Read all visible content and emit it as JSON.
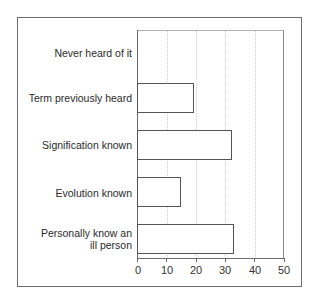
{
  "chart_data": {
    "type": "bar",
    "orientation": "horizontal",
    "title": "",
    "xlabel": "",
    "ylabel": "",
    "categories": [
      "Never heard of it",
      "Term previously heard",
      "Signification known",
      "Evolution known",
      "Personally know an ill person"
    ],
    "values": [
      0,
      19.5,
      32.5,
      15,
      33
    ],
    "xlim": [
      0,
      50
    ],
    "xticks": [
      "0",
      "10",
      "20",
      "30",
      "40",
      "50"
    ],
    "grid": "vertical dotted",
    "legend": "none"
  },
  "labels": {
    "cat0": "Never heard of it",
    "cat1": "Term previously heard",
    "cat2": "Signification known",
    "cat3": "Evolution known",
    "cat4_line1": "Personally know an",
    "cat4_line2": "ill person"
  },
  "ticks": [
    "0",
    "10",
    "20",
    "30",
    "40",
    "50"
  ],
  "colors": {
    "bar_fill": "#ffffff",
    "bar_border": "#555555",
    "axis": "#6a6a6a"
  }
}
